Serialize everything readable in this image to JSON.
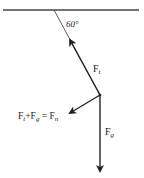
{
  "diagram": {
    "angle_label": "60°",
    "tension_label": {
      "base": "F",
      "sub": "t"
    },
    "gravity_label": {
      "base": "F",
      "sub": "g"
    },
    "resultant_label": {
      "t1": "F",
      "s1": "t",
      "plus": "+",
      "t2": "F",
      "s2": "g",
      "eq": " = ",
      "t3": "F",
      "s3": "n"
    },
    "colors": {
      "line": "#222222",
      "ceiling": "#444444"
    }
  }
}
